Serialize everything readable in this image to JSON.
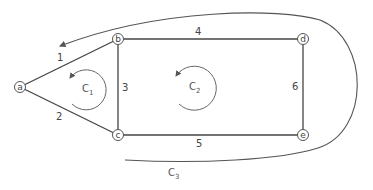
{
  "diagram": {
    "type": "graph-loops",
    "nodes": [
      {
        "id": "a",
        "label": "a",
        "x": 20,
        "y": 87
      },
      {
        "id": "b",
        "label": "b",
        "x": 118,
        "y": 39
      },
      {
        "id": "c",
        "label": "c",
        "x": 118,
        "y": 135
      },
      {
        "id": "d",
        "label": "d",
        "x": 303,
        "y": 39
      },
      {
        "id": "e",
        "label": "e",
        "x": 303,
        "y": 135
      }
    ],
    "edges": [
      {
        "label": "1",
        "from": "a",
        "to": "b"
      },
      {
        "label": "2",
        "from": "a",
        "to": "c"
      },
      {
        "label": "3",
        "from": "b",
        "to": "c"
      },
      {
        "label": "4",
        "from": "b",
        "to": "d"
      },
      {
        "label": "5",
        "from": "c",
        "to": "e"
      },
      {
        "label": "6",
        "from": "d",
        "to": "e"
      }
    ],
    "loops": [
      {
        "name": "C",
        "sub": "1",
        "direction": "counterclockwise"
      },
      {
        "name": "C",
        "sub": "2",
        "direction": "counterclockwise"
      },
      {
        "name": "C",
        "sub": "3",
        "direction": "counterclockwise",
        "outer": true
      }
    ],
    "colors": {
      "line": "#555555",
      "text": "#444444",
      "background": "#ffffff"
    }
  }
}
